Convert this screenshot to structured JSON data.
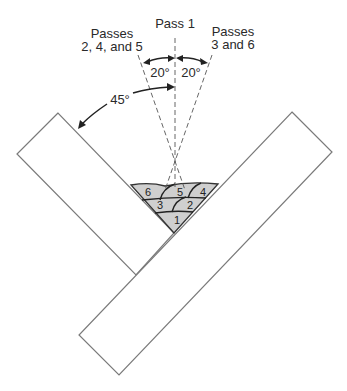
{
  "figure": {
    "labels": {
      "pass1": "Pass 1",
      "passes_left_line1": "Passes",
      "passes_left_line2": "2, 4, and 5",
      "passes_right_line1": "Passes",
      "passes_right_line2": "3 and 6",
      "angle_left": "20°",
      "angle_right": "20°",
      "angle_plate": "45°"
    },
    "bead_numbers": [
      "1",
      "2",
      "3",
      "4",
      "5",
      "6"
    ],
    "colors": {
      "weld_fill": "#cfcfcf",
      "plate_outline": "#7a7a7a",
      "line": "#222222"
    }
  }
}
